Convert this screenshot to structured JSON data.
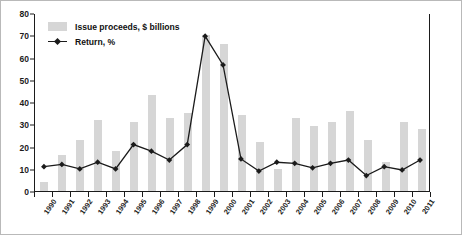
{
  "chart_data": {
    "type": "bar",
    "title": "",
    "xlabel": "",
    "ylabel": "",
    "ylim": [
      0,
      80
    ],
    "yticks": [
      0,
      10,
      20,
      30,
      40,
      50,
      60,
      70,
      80
    ],
    "grid": false,
    "legend_position": "top-left",
    "categories": [
      "1990",
      "1991",
      "1992",
      "1993",
      "1994",
      "1995",
      "1996",
      "1997",
      "1998",
      "1999",
      "2000",
      "2001",
      "2002",
      "2003",
      "2004",
      "2005",
      "2006",
      "2007",
      "2008",
      "2009",
      "2010",
      "2011"
    ],
    "series": [
      {
        "name": "Issue proceeds, $ billions",
        "type": "bar",
        "color": "#d6d6d6",
        "values": [
          4,
          16,
          23,
          32,
          18,
          31,
          43,
          33,
          35,
          70,
          66,
          34,
          22,
          10,
          33,
          29,
          31,
          36,
          23,
          13,
          31,
          28
        ]
      },
      {
        "name": "Return, %",
        "type": "line",
        "color": "#1b1b1b",
        "values": [
          11,
          12,
          10,
          13,
          10,
          21,
          18,
          14,
          21,
          70,
          57,
          14.5,
          9,
          13,
          12.5,
          10.5,
          12.5,
          14,
          7,
          11,
          9.5,
          14
        ]
      }
    ]
  },
  "legend": {
    "items": [
      {
        "label": "Issue proceeds, $ billions",
        "marker": "bar-swatch"
      },
      {
        "label": "Return, %",
        "marker": "line-diamond-marker"
      }
    ]
  },
  "axis": {
    "y_tick_labels": [
      "0",
      "10",
      "20",
      "30",
      "40",
      "50",
      "60",
      "70",
      "80"
    ],
    "x_tick_labels": [
      "1990",
      "1991",
      "1992",
      "1993",
      "1994",
      "1995",
      "1996",
      "1997",
      "1998",
      "1999",
      "2000",
      "2001",
      "2002",
      "2003",
      "2004",
      "2005",
      "2006",
      "2007",
      "2008",
      "2009",
      "2010",
      "2011"
    ]
  }
}
